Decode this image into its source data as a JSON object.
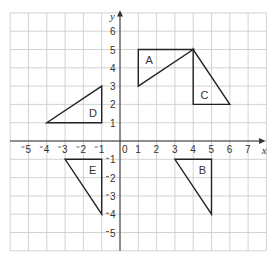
{
  "grid": {
    "x_min": -6,
    "x_max": 8,
    "y_min": -6,
    "y_max": 7,
    "origin_px": [
      120,
      141
    ],
    "unit_px": 18.3,
    "grid_color": "#c8c8c8",
    "axis_color": "#333333",
    "shape_color": "#222222"
  },
  "axes": {
    "x_label": "x",
    "y_label": "y",
    "origin_label": "0",
    "x_ticks": [
      {
        "value": -5,
        "label": "5"
      },
      {
        "value": -4,
        "label": "4"
      },
      {
        "value": -3,
        "label": "3"
      },
      {
        "value": -2,
        "label": "2"
      },
      {
        "value": -1,
        "label": "1"
      },
      {
        "value": 1,
        "label": "1"
      },
      {
        "value": 2,
        "label": "2"
      },
      {
        "value": 3,
        "label": "3"
      },
      {
        "value": 4,
        "label": "4"
      },
      {
        "value": 5,
        "label": "5"
      },
      {
        "value": 6,
        "label": "6"
      },
      {
        "value": 7,
        "label": "7"
      }
    ],
    "y_ticks": [
      {
        "value": 6,
        "label": "6"
      },
      {
        "value": 5,
        "label": "5"
      },
      {
        "value": 4,
        "label": "4"
      },
      {
        "value": 3,
        "label": "3"
      },
      {
        "value": 2,
        "label": "2"
      },
      {
        "value": 1,
        "label": "1"
      },
      {
        "value": -1,
        "label": "1"
      },
      {
        "value": -2,
        "label": "2"
      },
      {
        "value": -3,
        "label": "3"
      },
      {
        "value": -4,
        "label": "4"
      },
      {
        "value": -5,
        "label": "5"
      }
    ]
  },
  "triangles": [
    {
      "label": "A",
      "vertices": [
        [
          1,
          5
        ],
        [
          4,
          5
        ],
        [
          1,
          3
        ]
      ],
      "label_pos": [
        1.4,
        4.2
      ]
    },
    {
      "label": "B",
      "vertices": [
        [
          3,
          -1
        ],
        [
          5,
          -1
        ],
        [
          5,
          -4
        ]
      ],
      "label_pos": [
        4.3,
        -1.8
      ]
    },
    {
      "label": "C",
      "vertices": [
        [
          4,
          5
        ],
        [
          4,
          2
        ],
        [
          6,
          2
        ]
      ],
      "label_pos": [
        4.4,
        2.3
      ]
    },
    {
      "label": "D",
      "vertices": [
        [
          -4,
          1
        ],
        [
          -1,
          1
        ],
        [
          -1,
          3
        ]
      ],
      "label_pos": [
        -1.7,
        1.3
      ]
    },
    {
      "label": "E",
      "vertices": [
        [
          -3,
          -1
        ],
        [
          -1,
          -1
        ],
        [
          -1,
          -4
        ]
      ],
      "label_pos": [
        -1.7,
        -1.8
      ]
    }
  ]
}
